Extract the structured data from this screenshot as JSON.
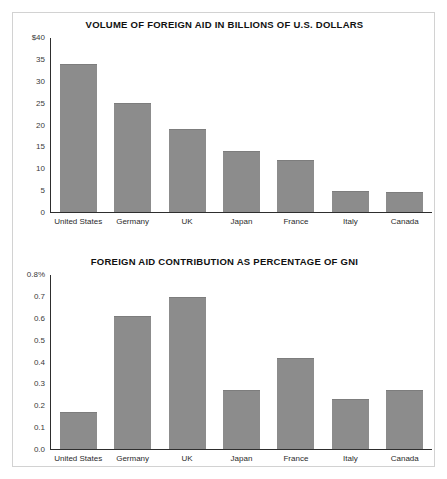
{
  "document": {
    "background_color": "#ffffff",
    "frame_border_color": "#d2d2d2",
    "bar_color": "#8c8c8c",
    "axis_color": "#2e2e2e"
  },
  "chart_data": [
    {
      "type": "bar",
      "title": "VOLUME OF FOREIGN AID IN BILLIONS OF U.S. DOLLARS",
      "xlabel": "",
      "ylabel": "",
      "categories": [
        "United States",
        "Germany",
        "UK",
        "Japan",
        "France",
        "Italy",
        "Canada"
      ],
      "values": [
        34,
        25,
        19,
        14,
        12,
        4.8,
        4.5
      ],
      "ylim": [
        0,
        40
      ],
      "yticks": [
        40,
        35,
        30,
        25,
        20,
        15,
        10,
        5,
        0
      ],
      "ytick_labels": [
        "$40",
        "35",
        "30",
        "25",
        "20",
        "15",
        "10",
        "5",
        "0"
      ],
      "grid": false,
      "legend": "none"
    },
    {
      "type": "bar",
      "title": "FOREIGN AID CONTRIBUTION AS PERCENTAGE OF GNI",
      "xlabel": "",
      "ylabel": "",
      "categories": [
        "United States",
        "Germany",
        "UK",
        "Japan",
        "France",
        "Italy",
        "Canada"
      ],
      "values": [
        0.17,
        0.61,
        0.7,
        0.27,
        0.42,
        0.23,
        0.27
      ],
      "ylim": [
        0,
        0.8
      ],
      "yticks": [
        0.8,
        0.7,
        0.6,
        0.5,
        0.4,
        0.3,
        0.2,
        0.1,
        0.0
      ],
      "ytick_labels": [
        "0.8%",
        "0.7",
        "0.6",
        "0.5",
        "0.4",
        "0.3",
        "0.2",
        "0.1",
        "0.0"
      ],
      "grid": false,
      "legend": "none"
    }
  ]
}
